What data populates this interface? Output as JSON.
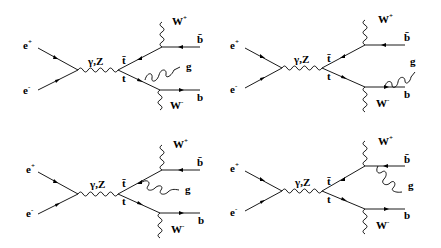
{
  "figure": {
    "labels": {
      "e_plus": "e",
      "e_plus_sup": "+",
      "e_minus": "e",
      "e_minus_sup": "-",
      "boson": "γ,Z",
      "top_bar": "t̄",
      "top": "t",
      "w_plus": "W",
      "w_plus_sup": "+",
      "w_minus": "W",
      "w_minus_sup": "-",
      "b_bar": "b̄",
      "b": "b",
      "gluon": "g"
    },
    "diagrams": [
      {
        "id": "d1",
        "gluon_emitted_from": "t"
      },
      {
        "id": "d2",
        "gluon_emitted_from": "b"
      },
      {
        "id": "d3",
        "gluon_emitted_from": "t̄"
      },
      {
        "id": "d4",
        "gluon_emitted_from": "b̄"
      }
    ]
  }
}
